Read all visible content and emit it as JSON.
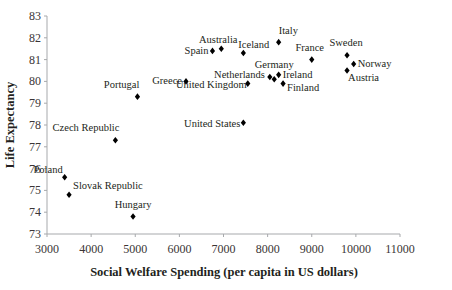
{
  "chart_data": {
    "type": "scatter",
    "title": "",
    "xlabel": "Social Welfare Spending (per capita in US dollars)",
    "ylabel": "Life Expectancy",
    "xlim": [
      3000,
      11000
    ],
    "ylim": [
      73,
      83
    ],
    "x_ticks": [
      3000,
      4000,
      5000,
      6000,
      7000,
      8000,
      9000,
      10000,
      11000
    ],
    "y_ticks": [
      73,
      74,
      75,
      76,
      77,
      78,
      79,
      80,
      81,
      82,
      83
    ],
    "grid": false,
    "legend": null,
    "marker": "diamond",
    "marker_color": "#000000",
    "points": [
      {
        "label": "Poland",
        "x": 3400,
        "y": 75.6,
        "anchor": "end",
        "dx": -2,
        "dy": -4
      },
      {
        "label": "Slovak Republic",
        "x": 3500,
        "y": 74.8,
        "anchor": "start",
        "dx": 4,
        "dy": -6
      },
      {
        "label": "Hungary",
        "x": 4950,
        "y": 73.8,
        "anchor": "middle",
        "dx": 0,
        "dy": -9
      },
      {
        "label": "Czech Republic",
        "x": 4550,
        "y": 77.3,
        "anchor": "end",
        "dx": 4,
        "dy": -9
      },
      {
        "label": "Portugal",
        "x": 5050,
        "y": 79.3,
        "anchor": "end",
        "dx": 2,
        "dy": -9
      },
      {
        "label": "Greece",
        "x": 6150,
        "y": 80.0,
        "anchor": "end",
        "dx": -4,
        "dy": 3
      },
      {
        "label": "United Kingdom",
        "x": 7550,
        "y": 79.9,
        "anchor": "end",
        "dx": -1,
        "dy": 4
      },
      {
        "label": "United States",
        "x": 7450,
        "y": 78.1,
        "anchor": "end",
        "dx": -3,
        "dy": 4
      },
      {
        "label": "Spain",
        "x": 6750,
        "y": 81.4,
        "anchor": "end",
        "dx": -4,
        "dy": 3
      },
      {
        "label": "Australia",
        "x": 6950,
        "y": 81.5,
        "anchor": "middle",
        "dx": -3,
        "dy": -6
      },
      {
        "label": "Iceland",
        "x": 7450,
        "y": 81.3,
        "anchor": "start",
        "dx": -5,
        "dy": -5
      },
      {
        "label": "Italy",
        "x": 8250,
        "y": 81.8,
        "anchor": "start",
        "dx": 0,
        "dy": -8
      },
      {
        "label": "Netherlands",
        "x": 8050,
        "y": 80.2,
        "anchor": "end",
        "dx": -5,
        "dy": 1
      },
      {
        "label": "Germany",
        "x": 8150,
        "y": 80.1,
        "anchor": "middle",
        "dx": 0,
        "dy": -11
      },
      {
        "label": "Ireland",
        "x": 8250,
        "y": 80.3,
        "anchor": "start",
        "dx": 4,
        "dy": 3
      },
      {
        "label": "Finland",
        "x": 8350,
        "y": 79.9,
        "anchor": "start",
        "dx": 4,
        "dy": 7
      },
      {
        "label": "France",
        "x": 9000,
        "y": 81.0,
        "anchor": "middle",
        "dx": -2,
        "dy": -9
      },
      {
        "label": "Sweden",
        "x": 9800,
        "y": 81.2,
        "anchor": "middle",
        "dx": -1,
        "dy": -9
      },
      {
        "label": "Norway",
        "x": 9950,
        "y": 80.8,
        "anchor": "start",
        "dx": 4,
        "dy": 3
      },
      {
        "label": "Austria",
        "x": 9800,
        "y": 80.5,
        "anchor": "start",
        "dx": 1,
        "dy": 10
      }
    ]
  }
}
